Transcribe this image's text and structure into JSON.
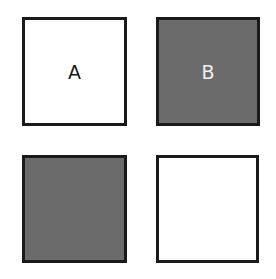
{
  "squares": [
    {
      "id": "top-left",
      "label": "A",
      "fill": "#ffffff",
      "text_color": "#1a1a1a"
    },
    {
      "id": "top-right",
      "label": "B",
      "fill": "#6b6b6b",
      "text_color": "#eeeeee"
    },
    {
      "id": "bottom-left",
      "label": "",
      "fill": "#6b6b6b"
    },
    {
      "id": "bottom-right",
      "label": "",
      "fill": "#ffffff"
    }
  ]
}
